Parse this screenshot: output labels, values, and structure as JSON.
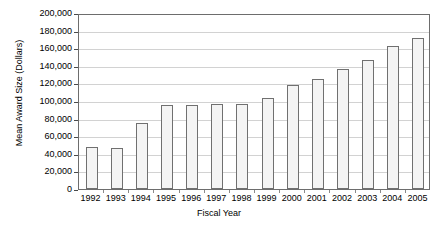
{
  "chart_data": {
    "type": "bar",
    "title": "",
    "xlabel": "Fiscal Year",
    "ylabel": "Mean Award Size (Dollars)",
    "categories": [
      "1992",
      "1993",
      "1994",
      "1995",
      "1996",
      "1997",
      "1998",
      "1999",
      "2000",
      "2001",
      "2002",
      "2003",
      "2004",
      "2005"
    ],
    "values": [
      48000,
      47000,
      75000,
      96000,
      96000,
      97000,
      97000,
      103000,
      118000,
      125000,
      136000,
      147000,
      163000,
      172000
    ],
    "ylim": [
      0,
      200000
    ],
    "ytick_values": [
      0,
      20000,
      40000,
      60000,
      80000,
      100000,
      120000,
      140000,
      160000,
      180000,
      200000
    ],
    "ytick_labels": [
      "0",
      "20,000",
      "40,000",
      "60,000",
      "80,000",
      "100,000",
      "120,000",
      "140,000",
      "160,000",
      "180,000",
      "200,000"
    ],
    "grid": true,
    "legend": false,
    "legend_position": "none",
    "bar_fill_color": "#f4f4f4",
    "bar_border_color": "#707070",
    "gridline_color": "#d2d2d2",
    "axis_color": "#6d6d6d",
    "background_color": "#ffffff"
  }
}
